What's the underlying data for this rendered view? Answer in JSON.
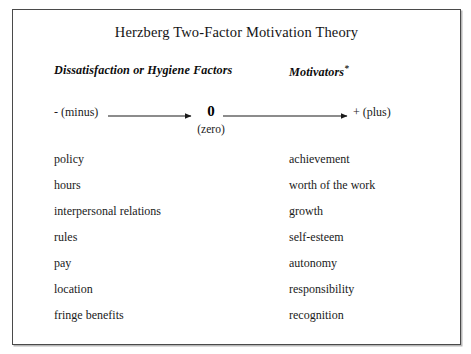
{
  "slide": {
    "title": "Herzberg Two-Factor Motivation Theory",
    "columns": {
      "left": {
        "header": "Dissatisfaction or Hygiene Factors",
        "items": [
          "policy",
          "hours",
          "interpersonal relations",
          "rules",
          "pay",
          "location",
          "fringe benefits"
        ]
      },
      "right": {
        "header": "Motivators",
        "header_marker": "*",
        "items": [
          "achievement",
          "worth of the work",
          "growth",
          "self-esteem",
          "autonomy",
          "responsibility",
          "recognition"
        ]
      }
    },
    "axis": {
      "left_label": "- (minus)",
      "center_label": "0",
      "center_sublabel": "(zero)",
      "right_label": "+ (plus)",
      "line_color": "#1a1a1a"
    },
    "colors": {
      "background": "#ffffff",
      "text": "#1a1a1a",
      "border": "#4a4a4a",
      "shadow": "#b8b8b8"
    }
  }
}
